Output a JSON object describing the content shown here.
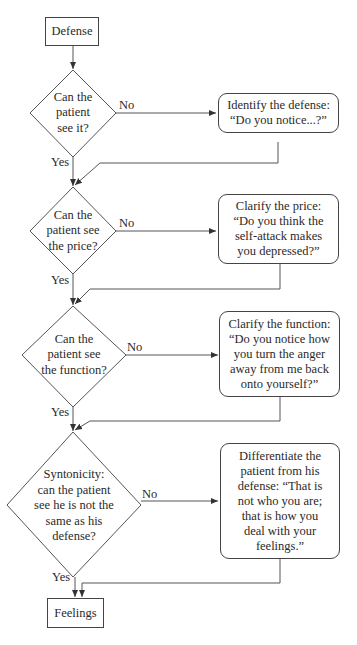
{
  "flowchart": {
    "start": {
      "label": "Defense"
    },
    "end": {
      "label": "Feelings"
    },
    "decisions": [
      {
        "lines": [
          "Can the",
          "patient",
          "see it?"
        ],
        "no_label": "No",
        "yes_label": "Yes"
      },
      {
        "lines": [
          "Can the",
          "patient see",
          "the price?"
        ],
        "no_label": "No",
        "yes_label": "Yes"
      },
      {
        "lines": [
          "Can the",
          "patient see",
          "the function?"
        ],
        "no_label": "No",
        "yes_label": "Yes"
      },
      {
        "lines": [
          "Syntonicity:",
          "can the patient",
          "see he is not the",
          "same as his",
          "defense?"
        ],
        "no_label": "No",
        "yes_label": "Yes"
      }
    ],
    "actions": [
      {
        "lines": [
          "Identify the defense:",
          "“Do you notice...?”"
        ]
      },
      {
        "lines": [
          "Clarify the price:",
          "“Do you think the",
          "self-attack makes",
          "you depressed?”"
        ]
      },
      {
        "lines": [
          "Clarify the function:",
          "“Do you notice how",
          "you turn the anger",
          "away from me back",
          "onto yourself?”"
        ]
      },
      {
        "lines": [
          "Differentiate the",
          "patient from his",
          "defense: “That is",
          "not who you are;",
          "that is how you",
          "deal with your",
          "feelings.”"
        ]
      }
    ]
  }
}
